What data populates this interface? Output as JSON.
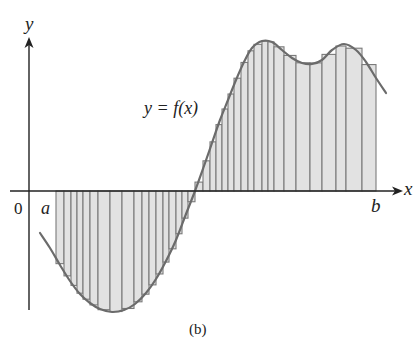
{
  "figure": {
    "caption": "(b)",
    "curve_label": "y = f(x)",
    "axis_labels": {
      "x": "x",
      "y": "y"
    },
    "tick_labels": {
      "origin": "0",
      "a": "a",
      "b": "b"
    },
    "colors": {
      "axis": "#222222",
      "curve": "#6b6b6b",
      "rect_fill": "#e2e2e2",
      "rect_stroke": "#7a7a7a"
    }
  },
  "chart_data": {
    "type": "area",
    "title": "",
    "xlabel": "x",
    "ylabel": "y",
    "x_markers": [
      "0",
      "a",
      "b"
    ],
    "curve_label": "y = f(x)",
    "pixel_geometry": {
      "origin": [
        29,
        191
      ],
      "x_axis_end": 400,
      "y_axis_top": 38,
      "a_px": 56,
      "b_px": 376
    },
    "curve_points_px": [
      [
        40,
        233
      ],
      [
        50,
        248
      ],
      [
        60,
        265
      ],
      [
        70,
        281
      ],
      [
        80,
        294
      ],
      [
        90,
        303
      ],
      [
        100,
        309
      ],
      [
        112,
        312
      ],
      [
        124,
        310
      ],
      [
        135,
        304
      ],
      [
        146,
        293
      ],
      [
        156,
        279
      ],
      [
        166,
        261
      ],
      [
        176,
        240
      ],
      [
        186,
        214
      ],
      [
        195,
        191
      ],
      [
        204,
        166
      ],
      [
        212,
        143
      ],
      [
        220,
        120
      ],
      [
        228,
        100
      ],
      [
        236,
        80
      ],
      [
        244,
        62
      ],
      [
        252,
        48
      ],
      [
        262,
        41
      ],
      [
        272,
        42
      ],
      [
        282,
        50
      ],
      [
        292,
        58
      ],
      [
        302,
        63
      ],
      [
        312,
        64
      ],
      [
        322,
        60
      ],
      [
        332,
        50
      ],
      [
        344,
        44
      ],
      [
        356,
        50
      ],
      [
        366,
        62
      ],
      [
        376,
        78
      ],
      [
        386,
        93
      ]
    ],
    "partition_px": [
      56,
      64,
      71,
      77,
      83,
      90,
      98,
      110,
      122,
      134,
      142,
      149,
      156,
      163,
      169,
      176,
      182,
      188,
      195,
      203,
      210,
      216,
      222,
      228,
      234,
      241,
      248,
      254,
      262,
      268,
      274,
      284,
      296,
      310,
      322,
      336,
      346,
      362,
      376
    ]
  }
}
